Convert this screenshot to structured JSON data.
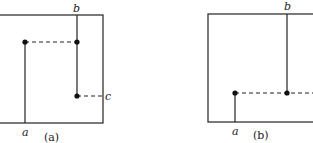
{
  "figure": {
    "panels": [
      {
        "id": "a",
        "caption": "(a)",
        "labels": {
          "a": "a",
          "b": "b",
          "c": "c"
        },
        "box": {
          "x": -2,
          "y": 15,
          "width": 105,
          "height": 108
        },
        "points": [
          {
            "name": "corner-dot-left",
            "x": 25,
            "y": 42
          },
          {
            "name": "corner-dot-upper-right",
            "x": 77,
            "y": 42
          },
          {
            "name": "end-dot-lower-right",
            "x": 77,
            "y": 96
          }
        ]
      },
      {
        "id": "b",
        "caption": "(b)",
        "labels": {
          "a": "a",
          "b": "b"
        },
        "box": {
          "x": 208,
          "y": 14,
          "width": 110,
          "height": 108
        },
        "points": [
          {
            "name": "dot-left",
            "x": 235,
            "y": 93
          },
          {
            "name": "dot-right",
            "x": 287,
            "y": 93
          }
        ]
      }
    ]
  }
}
